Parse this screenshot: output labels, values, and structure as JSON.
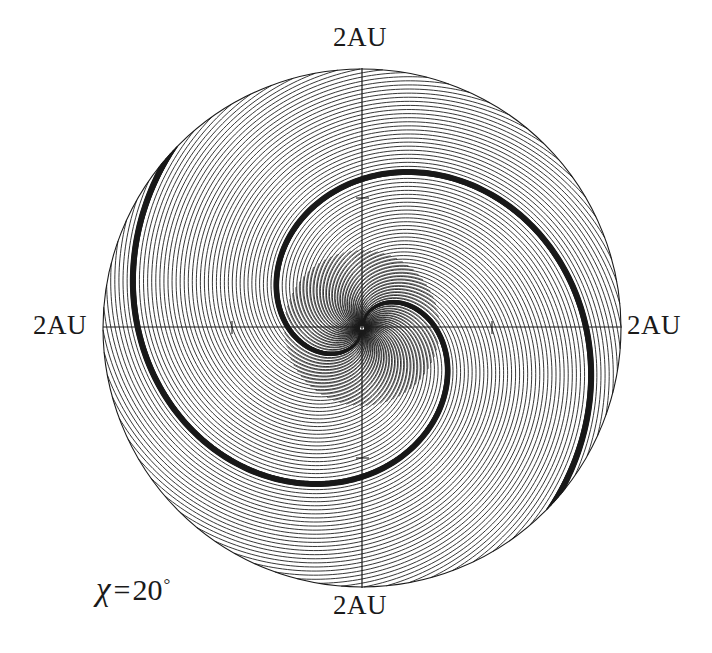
{
  "figure": {
    "kind": "polar-field-line-plot",
    "background_color": "#ffffff",
    "line_color": "#1a1a1a",
    "labels": {
      "top": "2AU",
      "bottom": "2AU",
      "left": "2AU",
      "right": "2AU"
    },
    "annotation": {
      "symbol": "χ",
      "equals": "=",
      "value": "20",
      "degree": "°",
      "full_text": "χ=20°"
    }
  },
  "chart_data": {
    "type": "line",
    "title": "",
    "subtitle": "",
    "xlabel": "",
    "ylabel": "",
    "legend": [],
    "grid": false,
    "projection": "polar-cartesian",
    "units": "AU",
    "axis_extent_au": 2,
    "xlim": [
      -2,
      2
    ],
    "ylim": [
      -2,
      2
    ],
    "tick_labels": [
      "2AU",
      "2AU",
      "2AU",
      "2AU"
    ],
    "tick_values_au": [
      1,
      2
    ],
    "boundary": {
      "shape": "circle",
      "center_px": [
        362,
        328
      ],
      "radius_px": 259,
      "radius_au": 2
    },
    "axes_px": {
      "horizontal_y": 327,
      "vertical_x": 362,
      "horizontal_span": [
        103,
        622
      ],
      "vertical_span": [
        68,
        588
      ],
      "tick_px": {
        "left": 232,
        "right": 492,
        "top": 198,
        "bottom": 458
      }
    },
    "series": [
      {
        "name": "archimedean-field-lines",
        "count": 72,
        "geometry": "archimedean-spiral",
        "direction": "counterclockwise-outward",
        "start_radius_au": 0.02,
        "end_radius_au": 2.0,
        "winding_turns": 0.86,
        "phase_step_deg": 5
      },
      {
        "name": "dense-crescent-bundle-upper",
        "count": 14,
        "geometry": "archimedean-spiral",
        "description": "tightly bunched field lines forming dark crescent in upper-right quadrant",
        "phase_center_deg": 88,
        "phase_spread_deg": 6
      },
      {
        "name": "dense-crescent-bundle-lower",
        "count": 14,
        "geometry": "archimedean-spiral",
        "description": "tightly bunched field lines forming dark crescent in lower-left quadrant",
        "phase_center_deg": 268,
        "phase_spread_deg": 6
      }
    ],
    "annotations": [
      {
        "text": "χ=20°",
        "position_px": [
          96,
          573
        ]
      }
    ]
  }
}
